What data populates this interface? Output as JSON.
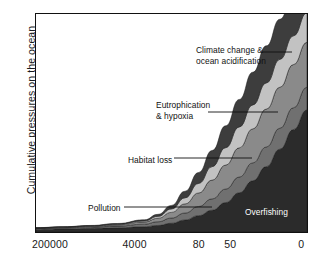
{
  "chart_data": {
    "type": "area",
    "title": "",
    "subtitle": "",
    "xlabel": "",
    "ylabel": "Cumulative pressures on the ocean",
    "x_tick_labels": [
      "200000",
      "4000",
      "80",
      "50",
      "0"
    ],
    "x_tick_positions_frac": [
      0.055,
      0.365,
      0.6,
      0.715,
      0.975
    ],
    "x_axis_note": "years before present, decreasing left to right",
    "y_axis_ticks": [],
    "ylim": [
      0,
      1
    ],
    "grid": false,
    "legend": "inline-callouts",
    "stacking_order_bottom_to_top": [
      "Overfishing",
      "Pollution",
      "Habitat loss",
      "Eutrophication & hypoxia",
      "Climate change & ocean acidification"
    ],
    "x": [
      0,
      0.1,
      0.2,
      0.3,
      0.4,
      0.45,
      0.5,
      0.55,
      0.6,
      0.65,
      0.7,
      0.75,
      0.8,
      0.85,
      0.9,
      0.95,
      1.0
    ],
    "series": [
      {
        "name": "Overfishing",
        "color": "#2b2b2b",
        "values": [
          0.012,
          0.014,
          0.016,
          0.019,
          0.024,
          0.03,
          0.04,
          0.055,
          0.075,
          0.1,
          0.135,
          0.18,
          0.235,
          0.3,
          0.38,
          0.47,
          0.56
        ]
      },
      {
        "name": "Pollution",
        "color": "#707070",
        "values": [
          0.004,
          0.005,
          0.006,
          0.008,
          0.012,
          0.017,
          0.024,
          0.032,
          0.042,
          0.052,
          0.062,
          0.072,
          0.082,
          0.09,
          0.096,
          0.1,
          0.104
        ]
      },
      {
        "name": "Habitat loss",
        "color": "#8a8a8a",
        "values": [
          0.002,
          0.003,
          0.004,
          0.006,
          0.01,
          0.016,
          0.026,
          0.042,
          0.062,
          0.086,
          0.11,
          0.134,
          0.156,
          0.174,
          0.188,
          0.198,
          0.206
        ]
      },
      {
        "name": "Eutrophication & hypoxia",
        "color": "#c2c2c2",
        "values": [
          0.001,
          0.001,
          0.002,
          0.003,
          0.005,
          0.009,
          0.016,
          0.028,
          0.044,
          0.062,
          0.08,
          0.096,
          0.11,
          0.12,
          0.128,
          0.132,
          0.136
        ]
      },
      {
        "name": "Climate change & ocean acidification",
        "color": "#3d3d3d",
        "values": [
          0.001,
          0.001,
          0.002,
          0.003,
          0.005,
          0.009,
          0.016,
          0.03,
          0.05,
          0.074,
          0.1,
          0.126,
          0.15,
          0.17,
          0.184,
          0.194,
          0.2
        ]
      }
    ],
    "callouts": [
      {
        "name": "climate-change",
        "lines": "Climate change &\nocean acidification",
        "label_x": 196,
        "label_y": 45,
        "leader_from": [
          262,
          52
        ],
        "leader_to": [
          292,
          52
        ],
        "inside": false
      },
      {
        "name": "eutrophication",
        "lines": "Eutrophication\n& hypoxia",
        "label_x": 156,
        "label_y": 100,
        "leader_from": [
          208,
          112
        ],
        "leader_to": [
          278,
          112
        ],
        "inside": false
      },
      {
        "name": "habitat-loss",
        "lines": "Habitat loss",
        "label_x": 128,
        "label_y": 155,
        "leader_from": [
          174,
          158
        ],
        "leader_to": [
          252,
          158
        ],
        "inside": false
      },
      {
        "name": "pollution",
        "lines": "Pollution",
        "label_x": 88,
        "label_y": 203,
        "leader_from": [
          124,
          207
        ],
        "leader_to": [
          212,
          207
        ],
        "inside": false
      },
      {
        "name": "overfishing",
        "lines": "Overfishing",
        "label_x": 245,
        "label_y": 207,
        "leader_from": null,
        "leader_to": null,
        "inside": true
      }
    ]
  },
  "colors": {
    "frame": "#111111",
    "background": "#ffffff",
    "text": "#1a1a1a",
    "leader_line": "#111111"
  }
}
